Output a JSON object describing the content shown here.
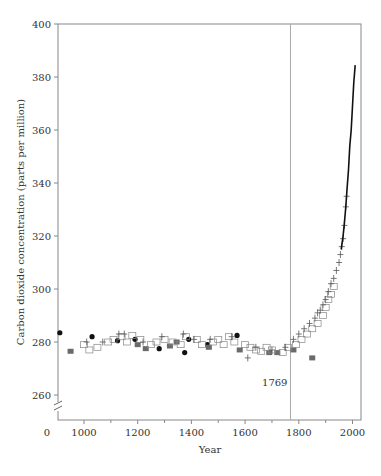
{
  "chart_data": {
    "type": "scatter",
    "title": "",
    "xlabel": "Year",
    "ylabel": "Carbon dioxide concentration (parts per million)",
    "xlim": [
      900,
      2020
    ],
    "ylim": [
      252,
      400
    ],
    "x_ticks": [
      0,
      1000,
      1200,
      1400,
      1600,
      1800,
      2000
    ],
    "x_minor_ticks": [
      1100,
      1300,
      1500,
      1700,
      1900
    ],
    "y_ticks": [
      260,
      280,
      300,
      320,
      340,
      360,
      380,
      400
    ],
    "axis_breaks": [
      "x",
      "y"
    ],
    "grid": false,
    "legend": null,
    "annotations": [
      {
        "type": "vline",
        "x": 1769,
        "label": "1769"
      }
    ],
    "series": [
      {
        "name": "filled-circles",
        "marker": "circle",
        "color": "#111111",
        "points": [
          [
            910,
            283.5
          ],
          [
            1030,
            282
          ],
          [
            1125,
            280.5
          ],
          [
            1190,
            281
          ],
          [
            1280,
            277.5
          ],
          [
            1375,
            276
          ],
          [
            1390,
            281
          ],
          [
            1570,
            282.5
          ],
          [
            1460,
            279
          ]
        ]
      },
      {
        "name": "filled-squares",
        "marker": "square",
        "color": "#6a6a6a",
        "points": [
          [
            950,
            276.5
          ],
          [
            1200,
            279
          ],
          [
            1230,
            277.5
          ],
          [
            1320,
            278.5
          ],
          [
            1345,
            280
          ],
          [
            1465,
            278
          ],
          [
            1580,
            277
          ],
          [
            1690,
            276
          ],
          [
            1720,
            276
          ],
          [
            1780,
            277
          ],
          [
            1850,
            274
          ]
        ]
      },
      {
        "name": "open-squares",
        "marker": "open-square",
        "color": "#888888",
        "points": [
          [
            1000,
            279
          ],
          [
            1020,
            277
          ],
          [
            1050,
            278
          ],
          [
            1090,
            280
          ],
          [
            1110,
            281
          ],
          [
            1140,
            282
          ],
          [
            1160,
            280
          ],
          [
            1180,
            282.5
          ],
          [
            1210,
            281
          ],
          [
            1250,
            279
          ],
          [
            1270,
            280
          ],
          [
            1300,
            281
          ],
          [
            1330,
            280
          ],
          [
            1360,
            279
          ],
          [
            1380,
            282
          ],
          [
            1420,
            281
          ],
          [
            1440,
            279
          ],
          [
            1480,
            280
          ],
          [
            1500,
            281
          ],
          [
            1520,
            279
          ],
          [
            1540,
            282
          ],
          [
            1560,
            280
          ],
          [
            1600,
            279
          ],
          [
            1620,
            278
          ],
          [
            1640,
            277
          ],
          [
            1660,
            276.5
          ],
          [
            1680,
            278
          ],
          [
            1700,
            277
          ],
          [
            1740,
            276
          ],
          [
            1760,
            278
          ],
          [
            1790,
            279
          ],
          [
            1810,
            281
          ],
          [
            1830,
            283
          ],
          [
            1850,
            285
          ],
          [
            1870,
            287
          ],
          [
            1890,
            290
          ],
          [
            1900,
            293
          ],
          [
            1910,
            296
          ],
          [
            1920,
            298
          ],
          [
            1930,
            301
          ]
        ]
      },
      {
        "name": "plus-markers",
        "marker": "plus",
        "color": "#555555",
        "points": [
          [
            1010,
            280
          ],
          [
            1070,
            280
          ],
          [
            1130,
            283
          ],
          [
            1150,
            283
          ],
          [
            1220,
            280
          ],
          [
            1290,
            282
          ],
          [
            1370,
            283
          ],
          [
            1410,
            281
          ],
          [
            1470,
            281
          ],
          [
            1550,
            282
          ],
          [
            1610,
            274
          ],
          [
            1640,
            278
          ],
          [
            1700,
            277
          ],
          [
            1750,
            278
          ],
          [
            1780,
            281
          ],
          [
            1800,
            283
          ],
          [
            1820,
            285
          ],
          [
            1840,
            287
          ],
          [
            1860,
            289
          ],
          [
            1870,
            291
          ],
          [
            1880,
            292
          ],
          [
            1890,
            294
          ],
          [
            1900,
            296
          ],
          [
            1910,
            299
          ],
          [
            1920,
            302
          ],
          [
            1930,
            304
          ],
          [
            1940,
            307
          ],
          [
            1950,
            310
          ],
          [
            1955,
            313
          ],
          [
            1960,
            316
          ],
          [
            1965,
            319
          ],
          [
            1970,
            324
          ],
          [
            1975,
            331
          ],
          [
            1978,
            335
          ]
        ]
      },
      {
        "name": "instrumental-record",
        "marker": "line",
        "color": "#111111",
        "points": [
          [
            1958,
            315
          ],
          [
            1965,
            320
          ],
          [
            1970,
            325
          ],
          [
            1975,
            331
          ],
          [
            1980,
            338
          ],
          [
            1985,
            345
          ],
          [
            1990,
            354
          ],
          [
            1995,
            360
          ],
          [
            2000,
            369
          ],
          [
            2005,
            378
          ],
          [
            2010,
            384.5
          ]
        ]
      }
    ]
  }
}
